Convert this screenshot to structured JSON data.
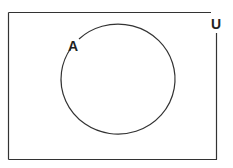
{
  "diagram": {
    "type": "venn",
    "universal_set": {
      "label": "U"
    },
    "sets": [
      {
        "label": "A"
      }
    ],
    "colors": {
      "stroke": "#333333",
      "background": "#ffffff"
    }
  }
}
